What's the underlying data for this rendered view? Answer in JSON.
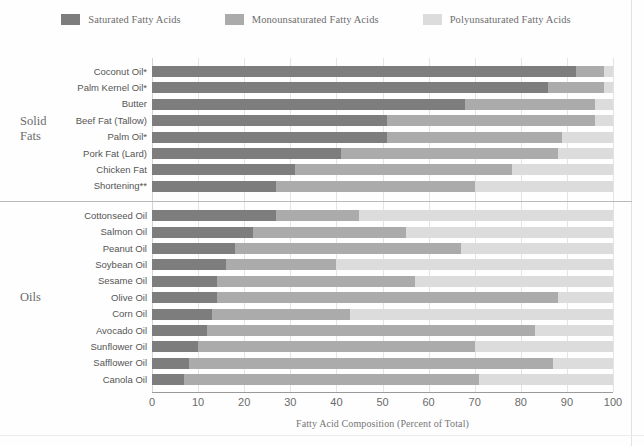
{
  "legend": {
    "items": [
      {
        "label": "Saturated Fatty Acids",
        "color": "#7d7d7d",
        "icon": "square-swatch-icon"
      },
      {
        "label": "Monounsaturated Fatty Acids",
        "color": "#ababab",
        "icon": "square-swatch-icon"
      },
      {
        "label": "Polyunsaturated Fatty Acids",
        "color": "#dcdcdc",
        "icon": "square-swatch-icon"
      }
    ]
  },
  "groups": [
    {
      "label": "Solid\nFats"
    },
    {
      "label": "Oils"
    }
  ],
  "axis": {
    "ticks": [
      "0",
      "10",
      "20",
      "30",
      "40",
      "50",
      "60",
      "70",
      "80",
      "90",
      "100"
    ],
    "title": "Fatty Acid Composition (Percent of Total)"
  },
  "chart_data": {
    "type": "bar",
    "orientation": "horizontal",
    "stacked": true,
    "title": "",
    "subtitle": "",
    "xlabel": "Fatty Acid Composition (Percent of Total)",
    "ylabel": "",
    "xlim": [
      0,
      100
    ],
    "xticks": [
      0,
      10,
      20,
      30,
      40,
      50,
      60,
      70,
      80,
      90,
      100
    ],
    "grid": "vertical",
    "legend_position": "top",
    "groups": [
      "Solid Fats",
      "Oils"
    ],
    "categories": [
      "Coconut Oil*",
      "Palm Kernel Oil*",
      "Butter",
      "Beef Fat (Tallow)",
      "Palm Oil*",
      "Pork Fat (Lard)",
      "Chicken Fat",
      "Shortening**",
      "Cottonseed  Oil",
      "Salmon Oil",
      "Peanut Oil",
      "Soybean Oil",
      "Sesame Oil",
      "Olive Oil",
      "Corn Oil",
      "Avocado Oil",
      "Sunflower Oil",
      "Safflower Oil",
      "Canola Oil"
    ],
    "category_groups": [
      "Solid Fats",
      "Solid Fats",
      "Solid Fats",
      "Solid Fats",
      "Solid Fats",
      "Solid Fats",
      "Solid Fats",
      "Solid Fats",
      "Oils",
      "Oils",
      "Oils",
      "Oils",
      "Oils",
      "Oils",
      "Oils",
      "Oils",
      "Oils",
      "Oils",
      "Oils"
    ],
    "series": [
      {
        "name": "Saturated Fatty Acids",
        "color": "#7d7d7d",
        "values": [
          92,
          86,
          68,
          51,
          51,
          41,
          31,
          27,
          27,
          22,
          18,
          16,
          14,
          14,
          13,
          12,
          10,
          8,
          7
        ]
      },
      {
        "name": "Monounsaturated Fatty Acids",
        "color": "#ababab",
        "values": [
          6,
          12,
          28,
          45,
          38,
          47,
          47,
          43,
          18,
          33,
          49,
          24,
          43,
          74,
          30,
          71,
          60,
          79,
          64
        ]
      },
      {
        "name": "Polyunsaturated Fatty Acids",
        "color": "#dcdcdc",
        "values": [
          2,
          2,
          4,
          4,
          11,
          12,
          22,
          30,
          55,
          45,
          33,
          60,
          43,
          12,
          57,
          17,
          30,
          13,
          29
        ]
      }
    ],
    "rows": [
      {
        "category": "Coconut Oil*",
        "group": "Solid Fats",
        "saturated": 92,
        "monounsaturated": 6,
        "polyunsaturated": 2
      },
      {
        "category": "Palm Kernel Oil*",
        "group": "Solid Fats",
        "saturated": 86,
        "monounsaturated": 12,
        "polyunsaturated": 2
      },
      {
        "category": "Butter",
        "group": "Solid Fats",
        "saturated": 68,
        "monounsaturated": 28,
        "polyunsaturated": 4
      },
      {
        "category": "Beef Fat (Tallow)",
        "group": "Solid Fats",
        "saturated": 51,
        "monounsaturated": 45,
        "polyunsaturated": 4
      },
      {
        "category": "Palm Oil*",
        "group": "Solid Fats",
        "saturated": 51,
        "monounsaturated": 38,
        "polyunsaturated": 11
      },
      {
        "category": "Pork Fat (Lard)",
        "group": "Solid Fats",
        "saturated": 41,
        "monounsaturated": 47,
        "polyunsaturated": 12
      },
      {
        "category": "Chicken Fat",
        "group": "Solid Fats",
        "saturated": 31,
        "monounsaturated": 47,
        "polyunsaturated": 22
      },
      {
        "category": "Shortening**",
        "group": "Solid Fats",
        "saturated": 27,
        "monounsaturated": 43,
        "polyunsaturated": 30
      },
      {
        "category": "Cottonseed  Oil",
        "group": "Oils",
        "saturated": 27,
        "monounsaturated": 18,
        "polyunsaturated": 55
      },
      {
        "category": "Salmon Oil",
        "group": "Oils",
        "saturated": 22,
        "monounsaturated": 33,
        "polyunsaturated": 45
      },
      {
        "category": "Peanut Oil",
        "group": "Oils",
        "saturated": 18,
        "monounsaturated": 49,
        "polyunsaturated": 33
      },
      {
        "category": "Soybean Oil",
        "group": "Oils",
        "saturated": 16,
        "monounsaturated": 24,
        "polyunsaturated": 60
      },
      {
        "category": "Sesame Oil",
        "group": "Oils",
        "saturated": 14,
        "monounsaturated": 43,
        "polyunsaturated": 43
      },
      {
        "category": "Olive Oil",
        "group": "Oils",
        "saturated": 14,
        "monounsaturated": 74,
        "polyunsaturated": 12
      },
      {
        "category": "Corn Oil",
        "group": "Oils",
        "saturated": 13,
        "monounsaturated": 30,
        "polyunsaturated": 57
      },
      {
        "category": "Avocado Oil",
        "group": "Oils",
        "saturated": 12,
        "monounsaturated": 71,
        "polyunsaturated": 17
      },
      {
        "category": "Sunflower Oil",
        "group": "Oils",
        "saturated": 10,
        "monounsaturated": 60,
        "polyunsaturated": 30
      },
      {
        "category": "Safflower Oil",
        "group": "Oils",
        "saturated": 8,
        "monounsaturated": 79,
        "polyunsaturated": 13
      },
      {
        "category": "Canola Oil",
        "group": "Oils",
        "saturated": 7,
        "monounsaturated": 64,
        "polyunsaturated": 29
      }
    ]
  }
}
